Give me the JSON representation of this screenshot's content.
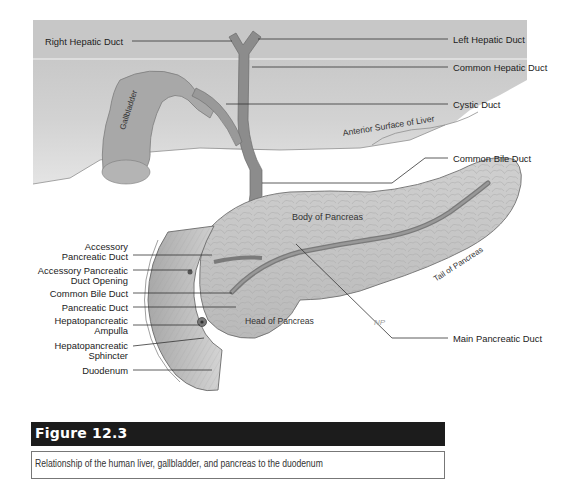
{
  "figure": {
    "title": "Figure 12.3",
    "caption": "Relationship of the human liver, gallbladder, and pancreas to the duodenum"
  },
  "labels": {
    "right": {
      "left_hepatic_duct": "Left Hepatic Duct",
      "common_hepatic_duct": "Common Hepatic Duct",
      "cystic_duct": "Cystic Duct",
      "common_bile_duct": "Common Bile Duct",
      "main_pancreatic_duct": "Main Pancreatic Duct"
    },
    "left": {
      "right_hepatic_duct": "Right Hepatic Duct",
      "accessory_pancreatic_duct_1": "Accessory",
      "accessory_pancreatic_duct_2": "Pancreatic Duct",
      "accessory_pancreatic_duct_opening_1": "Accessory Pancreatic",
      "accessory_pancreatic_duct_opening_2": "Duct Opening",
      "common_bile_duct": "Common Bile Duct",
      "pancreatic_duct": "Pancreatic Duct",
      "hepatopancreatic_ampulla_1": "Hepatopancreatic",
      "hepatopancreatic_ampulla_2": "Ampulla",
      "hepatopancreatic_sphincter_1": "Hepatopancreatic",
      "hepatopancreatic_sphincter_2": "Sphincter",
      "duodenum": "Duodenum"
    },
    "inline": {
      "gallbladder": "Gallbladder",
      "anterior_surface_of_liver": "Anterior Surface of Liver",
      "body_of_pancreas": "Body of Pancreas",
      "tail_of_pancreas": "Tail of Pancreas",
      "head_of_pancreas": "Head of Pancreas",
      "artist_signature": "NP"
    }
  },
  "colors": {
    "liver": "#cfcfcf",
    "liver_top_band": "#c4c4c4",
    "organ": "#a9a9a9",
    "duct": "#8a8a8a",
    "pancreas": "#c6c6c6",
    "duodenum": "#bdbdbd",
    "leader_line": "#333333",
    "figure_bar": "#1c1c1c"
  }
}
